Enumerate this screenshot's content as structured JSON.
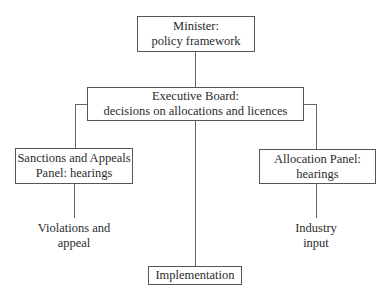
{
  "diagram": {
    "type": "org-chart",
    "nodes": {
      "minister": {
        "line1": "Minister:",
        "line2": "policy framework"
      },
      "executive_board": {
        "line1": "Executive Board:",
        "line2": "decisions on allocations and licences"
      },
      "sanctions_panel": {
        "line1": "Sanctions and Appeals",
        "line2": "Panel: hearings"
      },
      "allocation_panel": {
        "line1": "Allocation Panel:",
        "line2": "hearings"
      },
      "implementation": {
        "line1": "Implementation"
      }
    },
    "annotations": {
      "violations": {
        "line1": "Violations and",
        "line2": "appeal"
      },
      "industry": {
        "line1": "Industry",
        "line2": "input"
      }
    },
    "edges": [
      {
        "from": "minister",
        "to": "executive_board"
      },
      {
        "from": "executive_board",
        "to": "sanctions_panel"
      },
      {
        "from": "executive_board",
        "to": "allocation_panel"
      },
      {
        "from": "executive_board",
        "to": "implementation"
      },
      {
        "from": "sanctions_panel",
        "to": "violations"
      },
      {
        "from": "allocation_panel",
        "to": "industry"
      }
    ]
  }
}
